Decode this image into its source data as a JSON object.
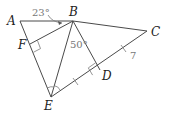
{
  "diagram": {
    "points": {
      "A": {
        "label": "A",
        "x": 20,
        "y": 21
      },
      "B": {
        "label": "B",
        "x": 73,
        "y": 21
      },
      "C": {
        "label": "C",
        "x": 147,
        "y": 31
      },
      "D": {
        "label": "D",
        "x": 100,
        "y": 70
      },
      "E": {
        "label": "E",
        "x": 51,
        "y": 97
      },
      "F": {
        "label": "F",
        "x": 30,
        "y": 44
      }
    },
    "segments": [
      "AB",
      "BC",
      "CE",
      "AE",
      "BE",
      "BD",
      "BF"
    ],
    "angle_labels": {
      "angle_ABF": "23°",
      "angle_EBD": "50°"
    },
    "length_labels": {
      "DC": "7"
    },
    "right_angles": [
      "F (BF ⟂ AE)",
      "D (BD ⟂ CE)"
    ],
    "tick_marks": [
      "ED",
      "DC"
    ],
    "angle_arcs": [
      "AEB",
      "BED"
    ]
  }
}
